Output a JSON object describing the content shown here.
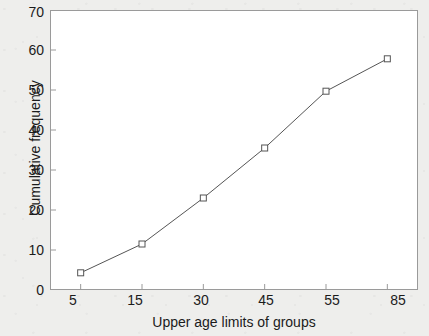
{
  "chart_data": {
    "type": "line",
    "title": "",
    "subtitle": "",
    "xlabel": "Upper age limits of groups",
    "ylabel": "Cumulative frequency",
    "categories": [
      "5",
      "15",
      "30",
      "45",
      "55",
      "85"
    ],
    "values": [
      4.3,
      11.5,
      23.0,
      35.5,
      49.7,
      57.8
    ],
    "series": [
      {
        "name": "Cumulative frequency",
        "values": [
          4.3,
          11.5,
          23.0,
          35.5,
          49.7,
          57.8
        ]
      }
    ],
    "ylim": [
      0,
      70
    ],
    "yticks": [
      0,
      10,
      20,
      30,
      40,
      50,
      60,
      70
    ],
    "ytick_labels": [
      "0",
      "10",
      "20",
      "30",
      "40",
      "50",
      "60",
      "70"
    ],
    "xtick_labels": [
      "5",
      "15",
      "30",
      "45",
      "55",
      "85"
    ],
    "grid": false,
    "legend": "none",
    "marker": "open-square",
    "line_color": "#555555",
    "marker_edge_color": "#555555",
    "marker_face_color": "#ffffff",
    "axis_color": "#9a9a9a",
    "plot_background": "#ffffff",
    "figure_background": "#eeeeec",
    "text_color": "#1b1b1b",
    "annotations": []
  }
}
